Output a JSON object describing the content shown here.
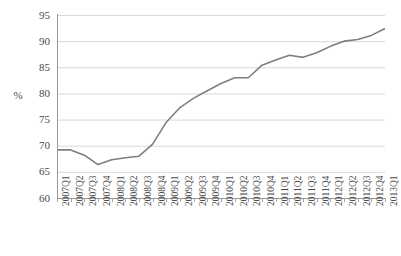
{
  "chart_data": {
    "type": "line",
    "title": "",
    "xlabel": "",
    "ylabel": "%",
    "ylim": [
      60,
      95
    ],
    "ytick_step": 5,
    "yticks": [
      95,
      90,
      85,
      80,
      75,
      70,
      65,
      60
    ],
    "grid": true,
    "legend": "none",
    "line_color": "#7f7f7f",
    "gridline_color": "#d9d9d9",
    "axis_color": "#9a9a9a",
    "categories": [
      "2007Q1",
      "2007Q2",
      "2007Q3",
      "2007Q4",
      "2008Q1",
      "2008Q2",
      "2008Q3",
      "2008Q4",
      "2009Q1",
      "2009Q2",
      "2009Q3",
      "2009Q4",
      "2010Q1",
      "2010Q2",
      "2010Q3",
      "2010Q4",
      "2011Q1",
      "2011Q2",
      "2011Q3",
      "2011Q4",
      "2012Q1",
      "2012Q2",
      "2012Q3",
      "2012Q4",
      "2013Q1"
    ],
    "series": [
      {
        "name": "%",
        "values": [
          69.2,
          69.2,
          68.2,
          66.4,
          67.3,
          67.7,
          68.0,
          70.3,
          74.5,
          77.3,
          79.1,
          80.5,
          81.9,
          83.0,
          83.0,
          85.4,
          86.4,
          87.3,
          86.9,
          87.8,
          89.0,
          90.0,
          90.3,
          91.1,
          92.4
        ]
      }
    ]
  },
  "axes": {
    "y_title": "%"
  }
}
